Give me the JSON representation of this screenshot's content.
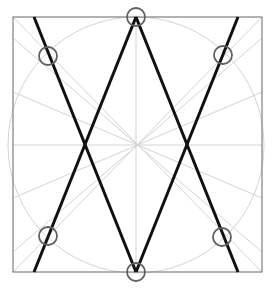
{
  "diagram": {
    "canvas": {
      "width": 272,
      "height": 290
    },
    "colors": {
      "background": "#ffffff",
      "frame": "#808080",
      "guide": "#d4d4d4",
      "thick_line": "#111111",
      "marker": "#606060"
    },
    "frame": {
      "x": 13,
      "y": 17,
      "width": 249,
      "height": 255
    },
    "center": {
      "x": 136,
      "y": 145
    },
    "guide_circle": {
      "cx": 136,
      "cy": 145,
      "r": 128
    },
    "guide_lines": [
      {
        "x1": 13,
        "y1": 145,
        "x2": 262,
        "y2": 145
      },
      {
        "x1": 136,
        "y1": 17,
        "x2": 136,
        "y2": 272
      },
      {
        "x1": 13,
        "y1": 17,
        "x2": 262,
        "y2": 272
      },
      {
        "x1": 262,
        "y1": 17,
        "x2": 13,
        "y2": 272
      },
      {
        "x1": 13,
        "y1": 38,
        "x2": 262,
        "y2": 252
      },
      {
        "x1": 262,
        "y1": 38,
        "x2": 13,
        "y2": 252
      },
      {
        "x1": 13,
        "y1": 92,
        "x2": 262,
        "y2": 198
      },
      {
        "x1": 262,
        "y1": 92,
        "x2": 13,
        "y2": 198
      }
    ],
    "thick_lines": [
      {
        "x1": 34,
        "y1": 17,
        "x2": 136,
        "y2": 272
      },
      {
        "x1": 136,
        "y1": 17,
        "x2": 34,
        "y2": 272
      },
      {
        "x1": 136,
        "y1": 17,
        "x2": 238,
        "y2": 272
      },
      {
        "x1": 238,
        "y1": 17,
        "x2": 136,
        "y2": 272
      }
    ],
    "markers": [
      {
        "name": "top",
        "cx": 136,
        "cy": 17,
        "r": 9
      },
      {
        "name": "upper-left",
        "cx": 48,
        "cy": 56,
        "r": 9
      },
      {
        "name": "upper-right",
        "cx": 223,
        "cy": 55,
        "r": 9
      },
      {
        "name": "lower-left",
        "cx": 48,
        "cy": 236,
        "r": 9
      },
      {
        "name": "lower-right",
        "cx": 222,
        "cy": 237,
        "r": 9
      },
      {
        "name": "bottom",
        "cx": 136,
        "cy": 272,
        "r": 9
      }
    ]
  }
}
